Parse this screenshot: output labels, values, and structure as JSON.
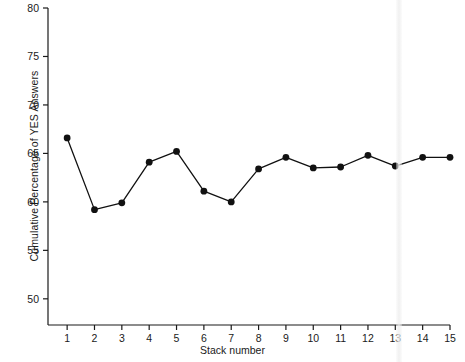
{
  "chart_data": {
    "type": "line",
    "title": "",
    "xlabel": "Stack number",
    "ylabel": "Cumulative Percentage of YES Answers",
    "x": [
      1,
      2,
      3,
      4,
      5,
      6,
      7,
      8,
      9,
      10,
      11,
      12,
      13,
      14,
      15
    ],
    "values": [
      66.6,
      59.2,
      59.9,
      64.1,
      65.2,
      61.1,
      60.0,
      63.4,
      64.6,
      63.5,
      63.6,
      64.8,
      63.7,
      64.6,
      64.6
    ],
    "xlim": [
      0.3,
      15.0
    ],
    "ylim": [
      47.3,
      80.0
    ],
    "xticks": [
      1,
      2,
      3,
      4,
      5,
      6,
      7,
      8,
      9,
      10,
      11,
      12,
      13,
      14,
      15
    ],
    "xticklabels": [
      "1",
      "2",
      "3",
      "4",
      "5",
      "6",
      "7",
      "8",
      "9",
      "10",
      "11",
      "12",
      "13",
      "14",
      "15"
    ],
    "yticks": [
      50,
      55,
      60,
      65,
      70,
      75,
      80
    ],
    "yticklabels": [
      "50",
      "55",
      "60",
      "65",
      "70",
      "75",
      "80"
    ],
    "grid": false,
    "legend": null,
    "marker": "filled-circle",
    "line_color": "#111111",
    "marker_color": "#111111",
    "background_color": "#ffffff"
  }
}
